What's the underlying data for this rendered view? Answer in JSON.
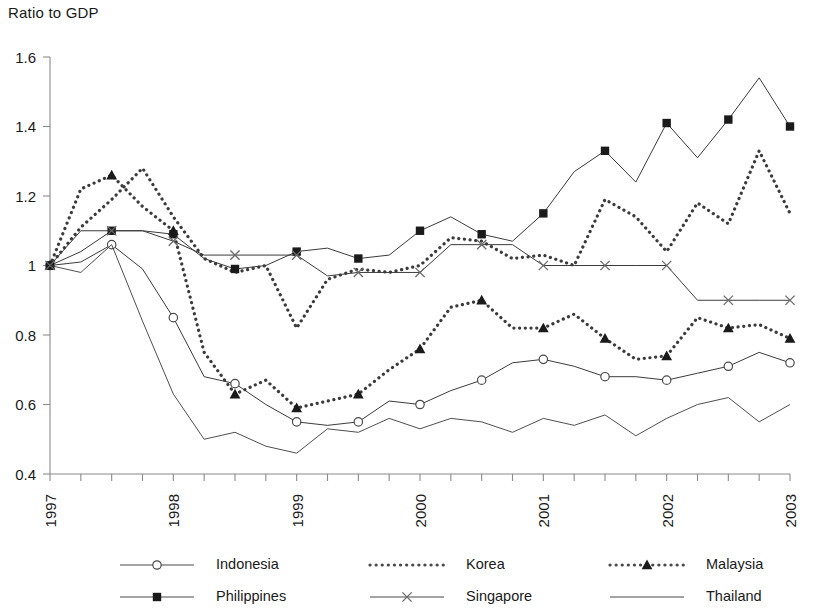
{
  "chart_data": {
    "type": "line",
    "title": "Ratio to GDP",
    "ylabel": "Ratio to GDP",
    "xlabel": "",
    "ylim": [
      0.4,
      1.6
    ],
    "ytick_labels": [
      "0.4",
      "0.6",
      "0.8",
      "1",
      "1.2",
      "1.4",
      "1.6"
    ],
    "ytick_values": [
      0.4,
      0.6,
      0.8,
      1.0,
      1.2,
      1.4,
      1.6
    ],
    "xtick_labels": [
      "1997",
      "1998",
      "1999",
      "2000",
      "2001",
      "2002",
      "2003"
    ],
    "x_label_values": [
      1997,
      1998,
      1999,
      2000,
      2001,
      2002,
      2003
    ],
    "x": [
      "1997Q1",
      "1997Q2",
      "1997Q3",
      "1997Q4",
      "1998Q1",
      "1998Q2",
      "1998Q3",
      "1998Q4",
      "1999Q1",
      "1999Q2",
      "1999Q3",
      "1999Q4",
      "2000Q1",
      "2000Q2",
      "2000Q3",
      "2000Q4",
      "2001Q1",
      "2001Q2",
      "2001Q3",
      "2001Q4",
      "2002Q1",
      "2002Q2",
      "2002Q3",
      "2002Q4",
      "2003Q1"
    ],
    "grid": false,
    "legend_position": "bottom",
    "series": [
      {
        "name": "Indonesia",
        "marker": "open-circle",
        "dash": "solid",
        "values": [
          1.0,
          1.01,
          1.06,
          0.99,
          0.85,
          0.68,
          0.66,
          0.6,
          0.55,
          0.54,
          0.55,
          0.61,
          0.6,
          0.64,
          0.67,
          0.72,
          0.73,
          0.71,
          0.68,
          0.68,
          0.67,
          0.69,
          0.71,
          0.75,
          0.72
        ]
      },
      {
        "name": "Korea",
        "marker": "none",
        "dash": "dotted",
        "values": [
          1.0,
          1.11,
          1.19,
          1.28,
          1.14,
          1.02,
          0.98,
          1.0,
          0.82,
          0.96,
          0.99,
          0.98,
          1.0,
          1.08,
          1.07,
          1.02,
          1.03,
          1.0,
          1.19,
          1.14,
          1.04,
          1.18,
          1.12,
          1.33,
          1.15
        ]
      },
      {
        "name": "Malaysia",
        "marker": "filled-triangle",
        "dash": "dotted",
        "values": [
          1.0,
          1.22,
          1.26,
          1.17,
          1.1,
          0.75,
          0.63,
          0.67,
          0.59,
          0.61,
          0.63,
          0.7,
          0.76,
          0.88,
          0.9,
          0.82,
          0.82,
          0.86,
          0.79,
          0.73,
          0.74,
          0.85,
          0.82,
          0.83,
          0.79
        ]
      },
      {
        "name": "Philippines",
        "marker": "filled-square",
        "dash": "solid",
        "values": [
          1.0,
          1.04,
          1.1,
          1.1,
          1.09,
          1.02,
          0.99,
          1.0,
          1.04,
          1.05,
          1.02,
          1.03,
          1.1,
          1.14,
          1.09,
          1.07,
          1.15,
          1.27,
          1.33,
          1.24,
          1.41,
          1.31,
          1.42,
          1.54,
          1.4
        ]
      },
      {
        "name": "Singapore",
        "marker": "cross-x",
        "dash": "solid",
        "values": [
          1.0,
          1.1,
          1.1,
          1.1,
          1.07,
          1.03,
          1.03,
          1.03,
          1.03,
          0.97,
          0.98,
          0.98,
          0.98,
          1.06,
          1.06,
          1.06,
          1.0,
          1.0,
          1.0,
          1.0,
          1.0,
          0.9,
          0.9,
          0.9,
          0.9
        ]
      },
      {
        "name": "Thailand",
        "marker": "none",
        "dash": "solid",
        "values": [
          1.0,
          0.98,
          1.06,
          0.84,
          0.63,
          0.5,
          0.52,
          0.48,
          0.46,
          0.53,
          0.52,
          0.56,
          0.53,
          0.56,
          0.55,
          0.52,
          0.56,
          0.54,
          0.57,
          0.51,
          0.56,
          0.6,
          0.62,
          0.55,
          0.6
        ]
      }
    ]
  },
  "legend": {
    "entries": [
      {
        "label": "Indonesia",
        "marker": "open-circle",
        "dash": "solid"
      },
      {
        "label": "Korea",
        "marker": "none",
        "dash": "dotted"
      },
      {
        "label": "Malaysia",
        "marker": "filled-triangle",
        "dash": "dotted"
      },
      {
        "label": "Philippines",
        "marker": "filled-square",
        "dash": "solid"
      },
      {
        "label": "Singapore",
        "marker": "cross-x",
        "dash": "solid"
      },
      {
        "label": "Thailand",
        "marker": "none",
        "dash": "solid"
      }
    ]
  },
  "colors": {
    "ink": "#1a1a1a",
    "series": "#3b3b3b",
    "axis": "#8a8a8a",
    "background": "#ffffff"
  }
}
